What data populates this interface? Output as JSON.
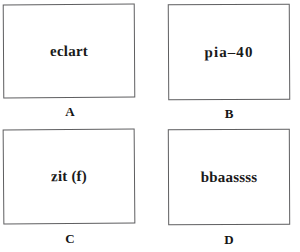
{
  "figure": {
    "layout": "2x2-grid",
    "background_color": "#ffffff",
    "border_color": "#5e5e60",
    "text_color": "#1a1a1a"
  },
  "panels": [
    {
      "id": "a",
      "text": "eclart",
      "label": "A"
    },
    {
      "id": "b",
      "text": "pia–40",
      "label": "B"
    },
    {
      "id": "c",
      "text": "zit (f)",
      "label": "C"
    },
    {
      "id": "d",
      "text": "bbaassss",
      "label": "D"
    }
  ]
}
